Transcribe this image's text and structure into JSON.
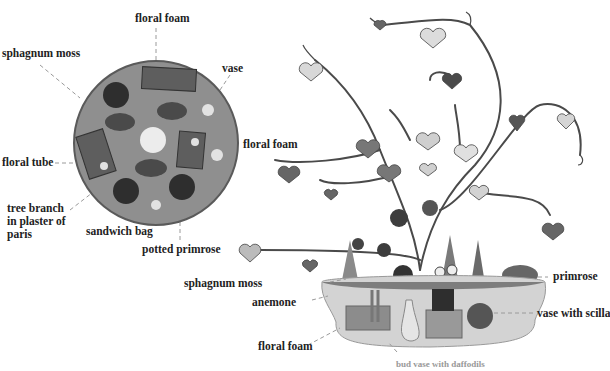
{
  "top_view": {
    "labels": {
      "floral_foam_top": "floral foam",
      "sphagnum_moss": "sphagnum moss",
      "vase": "vase",
      "floral_foam_right": "floral foam",
      "floral_tube": "floral tube",
      "tree_branch": "tree branch in plaster of paris",
      "sandwich_bag": "sandwich bag",
      "potted_primrose": "potted primrose"
    }
  },
  "side_view": {
    "labels": {
      "sphagnum_moss": "sphagnum moss",
      "anemone": "anemone",
      "floral_foam": "floral foam",
      "primrose": "primrose",
      "vase_with_scilla": "vase with scilla",
      "bottom_cut": "bud vase with daffodils"
    }
  },
  "colors": {
    "tray": "#8f8f8f",
    "tray_edge": "#5a5a5a",
    "dark": "#2e2e2e",
    "foam": "#5e5e5e",
    "branch": "#4a4a4a",
    "pot": "#cfcfcf",
    "leader": "#9a9a9a"
  }
}
